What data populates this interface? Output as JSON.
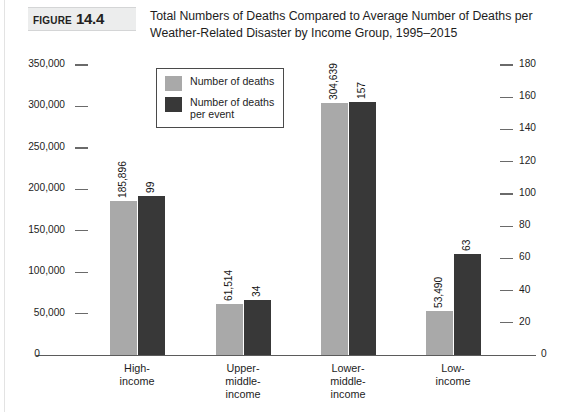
{
  "figure": {
    "word": "FIGURE",
    "number": "14.4"
  },
  "title": "Total Numbers of Deaths Compared to Average Number of Deaths per Weather-Related Disaster by Income Group, 1995–2015",
  "colors": {
    "series_deaths": "#a9a9a9",
    "series_per_event": "#383838",
    "axis": "#5b5b5b",
    "text": "#1d1d1d",
    "figure_band": "#eceded"
  },
  "chart_data": {
    "type": "bar",
    "title": "Total Numbers of Deaths Compared to Average Number of Deaths per Weather-Related Disaster by Income Group, 1995–2015",
    "xlabel": "",
    "ylabel": "",
    "grid": false,
    "legend_position": "top-left-inside",
    "categories": [
      "High-\nincome",
      "Upper-\nmiddle-\nincome",
      "Lower-\nmiddle-\nincome",
      "Low-\nincome"
    ],
    "series": [
      {
        "name": "Number of deaths",
        "axis": "left",
        "color": "#a9a9a9",
        "values": [
          185896,
          61514,
          304639,
          53490
        ],
        "labels": [
          "185,896",
          "61,514",
          "304,639",
          "53,490"
        ]
      },
      {
        "name": "Number of deaths\nper event",
        "axis": "right",
        "color": "#383838",
        "values": [
          99,
          34,
          157,
          63
        ],
        "labels": [
          "99",
          "34",
          "157",
          "63"
        ]
      }
    ],
    "left_axis": {
      "ylim": [
        0,
        350000
      ],
      "ticks": [
        0,
        50000,
        100000,
        150000,
        200000,
        250000,
        300000,
        350000
      ],
      "tick_labels": [
        "0",
        "50,000",
        "100,000",
        "150,000",
        "200,000",
        "250,000",
        "300,000",
        "350,000"
      ]
    },
    "right_axis": {
      "ylim": [
        0,
        180
      ],
      "ticks": [
        0,
        20,
        40,
        60,
        80,
        100,
        120,
        140,
        160,
        180
      ],
      "tick_labels": [
        "0",
        "20",
        "40",
        "60",
        "80",
        "100",
        "120",
        "140",
        "160",
        "180"
      ]
    }
  }
}
